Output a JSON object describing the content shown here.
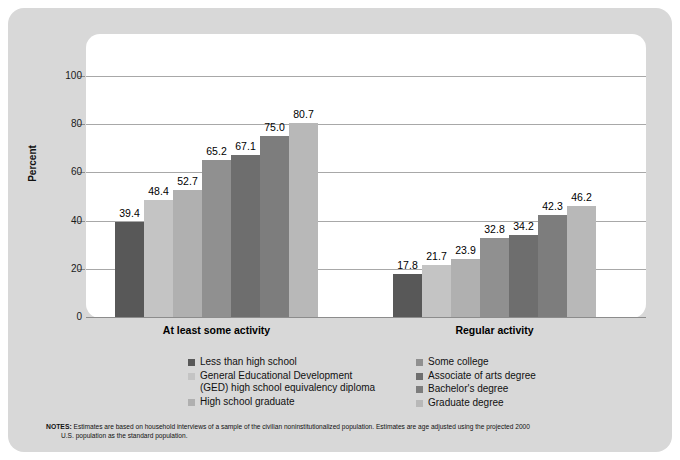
{
  "chart_data": {
    "type": "bar",
    "title": "",
    "xlabel": "",
    "ylabel": "Percent",
    "ylim": [
      0,
      100
    ],
    "yticks": [
      0,
      20,
      40,
      60,
      80,
      100
    ],
    "grid": true,
    "legend_position": "bottom",
    "categories": [
      "At least some activity",
      "Regular activity"
    ],
    "series": [
      {
        "name": "Less than high school",
        "color": "#585858",
        "values": [
          39.4,
          17.8
        ]
      },
      {
        "name": "General Educational Development\n(GED) high school equivalency diploma",
        "color": "#c4c4c4",
        "values": [
          48.4,
          21.7
        ]
      },
      {
        "name": "High school graduate",
        "color": "#b0b0b0",
        "values": [
          52.7,
          23.9
        ]
      },
      {
        "name": "Some college",
        "color": "#909090",
        "values": [
          65.2,
          32.8
        ]
      },
      {
        "name": "Associate of arts degree",
        "color": "#6e6e6e",
        "values": [
          67.1,
          34.2
        ]
      },
      {
        "name": "Bachelor's degree",
        "color": "#7d7d7d",
        "values": [
          75.0,
          42.3
        ]
      },
      {
        "name": "Graduate degree",
        "color": "#b8b8b8",
        "values": [
          80.7,
          46.2
        ]
      }
    ]
  },
  "axis": {
    "y_title": "Percent",
    "y_tick_labels": [
      "100",
      "80",
      "60",
      "40",
      "20",
      "0"
    ],
    "group_labels": [
      "At least some activity",
      "Regular activity"
    ]
  },
  "legend": {
    "left_column": [
      {
        "label": "Less than high school",
        "color": "#585858"
      },
      {
        "label": "General Educational Development\n(GED) high school equivalency diploma",
        "color": "#c4c4c4"
      },
      {
        "label": "High school graduate",
        "color": "#b0b0b0"
      }
    ],
    "right_column": [
      {
        "label": "Some college",
        "color": "#909090"
      },
      {
        "label": "Associate of arts degree",
        "color": "#6e6e6e"
      },
      {
        "label": "Bachelor's degree",
        "color": "#7d7d7d"
      },
      {
        "label": "Graduate degree",
        "color": "#b8b8b8"
      }
    ]
  },
  "notes": {
    "label": "NOTES:",
    "line1": "Estimates are based on household interviews of a sample of the civilian noninstitutionalized population. Estimates are age adjusted using the projected 2000",
    "line2": "U.S. population as the standard population."
  }
}
